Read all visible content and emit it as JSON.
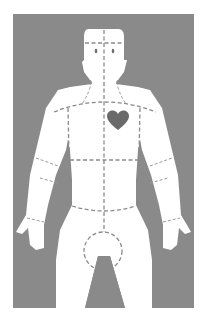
{
  "figure": {
    "colors": {
      "background": "#ffffff",
      "panel": "#8a8a8a",
      "body": "#ffffff",
      "heart": "#6a6a6a",
      "dashed_lines": "#8a8a8a"
    },
    "regions": [
      {
        "name": "head",
        "label": "Head"
      },
      {
        "name": "neck",
        "label": "Neck"
      },
      {
        "name": "chest",
        "label": "Chest"
      },
      {
        "name": "abdomen",
        "label": "Abdomen"
      },
      {
        "name": "left-arm",
        "label": "Left arm"
      },
      {
        "name": "right-arm",
        "label": "Right arm"
      },
      {
        "name": "pelvis",
        "label": "Pelvis"
      },
      {
        "name": "left-leg",
        "label": "Left leg"
      },
      {
        "name": "right-leg",
        "label": "Right leg"
      }
    ],
    "markers": [
      {
        "name": "heart",
        "label": "Heart",
        "icon": "heart-icon"
      }
    ]
  }
}
